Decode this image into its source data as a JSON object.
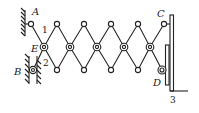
{
  "diagram": {
    "type": "scissor-linkage mechanism",
    "labels": {
      "A": "A",
      "B": "B",
      "C": "C",
      "D": "D",
      "E": "E",
      "link1": "1",
      "link2": "2",
      "part3": "3"
    },
    "colors": {
      "line": "#222222",
      "background": "#ffffff"
    }
  }
}
